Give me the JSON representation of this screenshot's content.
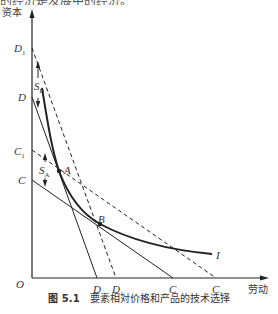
{
  "top_text_fragment": "的经济是发展中的经济。",
  "figure": {
    "caption_number": "图 5.1",
    "caption_title": "要素相对价格和产品的技术选择"
  },
  "axes": {
    "y_label": "资本",
    "x_label": "劳动",
    "origin_label": "O"
  },
  "y_axis_points": [
    {
      "label": "D",
      "sub": "1"
    },
    {
      "label": "D",
      "sub": ""
    },
    {
      "label": "C",
      "sub": "1"
    },
    {
      "label": "C",
      "sub": ""
    }
  ],
  "x_axis_points": [
    {
      "label": "D",
      "sub": ""
    },
    {
      "label": "D",
      "sub": "1"
    },
    {
      "label": "C",
      "sub": ""
    },
    {
      "label": "C",
      "sub": "1"
    }
  ],
  "points": {
    "A": "A",
    "B": "B"
  },
  "curve_label": "I",
  "shift_labels": {
    "S_B": {
      "main": "S",
      "sub": "B"
    },
    "S_A": {
      "main": "S",
      "sub": "A"
    }
  },
  "lines": [
    {
      "name": "DD",
      "style": "solid",
      "from": "D(y)",
      "to": "D(x)"
    },
    {
      "name": "D1D1",
      "style": "dashed",
      "from": "D1(y)",
      "to": "D1(x)"
    },
    {
      "name": "CC",
      "style": "solid",
      "from": "C(y)",
      "to": "C(x)"
    },
    {
      "name": "C1C1",
      "style": "dashed",
      "from": "C1(y)",
      "to": "C1(x)"
    }
  ],
  "colors": {
    "ink": "#222222",
    "background": "#ffffff"
  }
}
